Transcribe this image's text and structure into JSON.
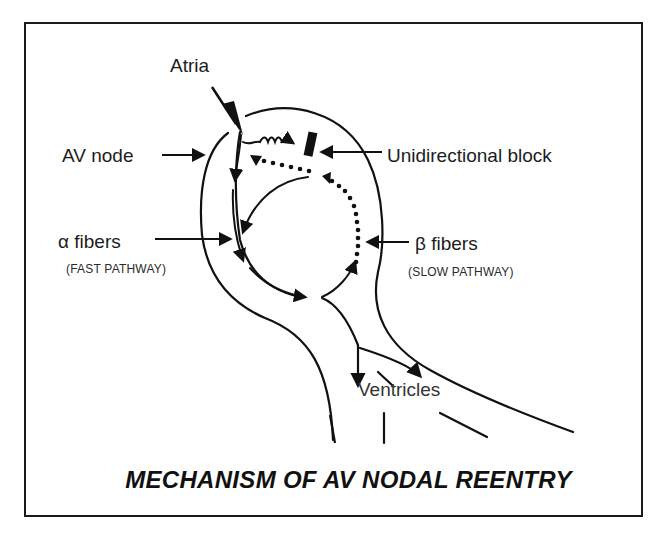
{
  "figure": {
    "title": "MECHANISM OF AV NODAL REENTRY",
    "colors": {
      "ink": "#111111",
      "background": "#ffffff",
      "frame": "#1a1a1a"
    },
    "labels": {
      "atria": "Atria",
      "av_node": "AV node",
      "unidirectional_block": "Unidirectional block",
      "alpha_fibers": "α fibers",
      "alpha_pathway": "(FAST PATHWAY)",
      "beta_fibers": "β fibers",
      "beta_pathway": "(SLOW PATHWAY)",
      "ventricles": "Ventricles"
    },
    "legend_semantics": {
      "solid_arrows": "anterograde conduction via fast (α) pathway",
      "dotted_arrows": "retrograde conduction via slow (β) pathway",
      "wavy_arrow": "impulse blocked at unidirectional block",
      "black_bar": "unidirectional block"
    }
  }
}
